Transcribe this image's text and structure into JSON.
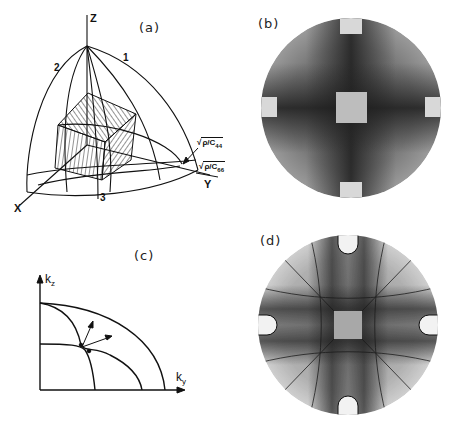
{
  "figure": {
    "panels": [
      {
        "id": "a",
        "label": "(a)",
        "kind": "3D slowness-surface diagram",
        "axis_labels": {
          "z": "Z",
          "x": "X",
          "y": "Y"
        },
        "curve_labels": [
          "1",
          "2",
          "3"
        ],
        "annotations": {
          "c44": {
            "prefix": "√",
            "text": "ρ/C",
            "sub": "44"
          },
          "c66": {
            "prefix": "√",
            "text": "ρ/C",
            "sub": "66"
          }
        }
      },
      {
        "id": "b",
        "label": "(b)",
        "kind": "phonon focusing image (disk with dark cross and central light square)"
      },
      {
        "id": "c",
        "label": "(c)",
        "kind": "slowness curves in kz-ky plane",
        "axis_labels": {
          "vertical": "k",
          "vertical_sub": "z",
          "horizontal": "k",
          "horizontal_sub": "y"
        }
      },
      {
        "id": "d",
        "label": "(d)",
        "kind": "phonon focusing image with caustic lines"
      }
    ]
  },
  "colors": {
    "ink": "#111111",
    "dark_pattern": "#2a2a2a",
    "mid_pattern": "#6d6d6d",
    "light_pattern": "#bdbdbd",
    "background": "#ffffff"
  }
}
